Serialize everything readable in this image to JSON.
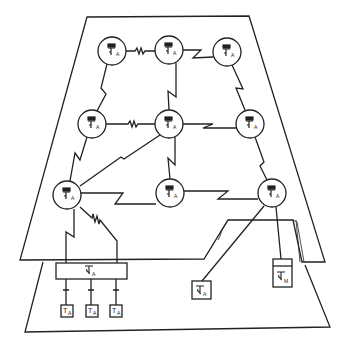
{
  "diagram": {
    "type": "network-topology",
    "colors": {
      "stroke": "#222222",
      "background": "#ffffff"
    },
    "planes": [
      {
        "id": "upper-plane",
        "label": ""
      },
      {
        "id": "lower-plane",
        "label": ""
      }
    ],
    "nodes": [
      {
        "id": "n1",
        "symbol": "T",
        "subscript": "A",
        "x": 112,
        "y": 51
      },
      {
        "id": "n2",
        "symbol": "T",
        "subscript": "A",
        "x": 169,
        "y": 50
      },
      {
        "id": "n3",
        "symbol": "T",
        "subscript": "A",
        "x": 227,
        "y": 52
      },
      {
        "id": "n4",
        "symbol": "T",
        "subscript": "A",
        "x": 92,
        "y": 124
      },
      {
        "id": "n5",
        "symbol": "T",
        "subscript": "A",
        "x": 169,
        "y": 124
      },
      {
        "id": "n6",
        "symbol": "T",
        "subscript": "A",
        "x": 250,
        "y": 124
      },
      {
        "id": "n7",
        "symbol": "T",
        "subscript": "A",
        "x": 67,
        "y": 195
      },
      {
        "id": "n8",
        "symbol": "T",
        "subscript": "A",
        "x": 170,
        "y": 193
      },
      {
        "id": "n9",
        "symbol": "T",
        "subscript": "A",
        "x": 272,
        "y": 193
      }
    ],
    "links": [
      {
        "from": "n1",
        "to": "n2",
        "kind": "resistor"
      },
      {
        "from": "n2",
        "to": "n3",
        "kind": "lightning"
      },
      {
        "from": "n1",
        "to": "n4",
        "kind": "lightning"
      },
      {
        "from": "n2",
        "to": "n5",
        "kind": "lightning"
      },
      {
        "from": "n3",
        "to": "n6",
        "kind": "lightning"
      },
      {
        "from": "n4",
        "to": "n5",
        "kind": "resistor"
      },
      {
        "from": "n5",
        "to": "n6",
        "kind": "lightning"
      },
      {
        "from": "n4",
        "to": "n7",
        "kind": "lightning"
      },
      {
        "from": "n5",
        "to": "n7",
        "kind": "lightning"
      },
      {
        "from": "n5",
        "to": "n8",
        "kind": "lightning"
      },
      {
        "from": "n6",
        "to": "n9",
        "kind": "lightning"
      },
      {
        "from": "n7",
        "to": "n8",
        "kind": "lightning"
      },
      {
        "from": "n8",
        "to": "n9",
        "kind": "lightning"
      },
      {
        "from": "n7",
        "to": "bus-box",
        "kind": "lightning"
      },
      {
        "from": "n7",
        "to": "bus-box",
        "kind": "resistor"
      },
      {
        "from": "n9",
        "to": "box-a",
        "kind": "line"
      },
      {
        "from": "n9",
        "to": "box-m",
        "kind": "line"
      }
    ],
    "bus_box": {
      "symbol": "T",
      "subscript": "A"
    },
    "terminals": [
      {
        "symbol": "T",
        "subscript": "A"
      },
      {
        "symbol": "T",
        "subscript": "A"
      },
      {
        "symbol": "T",
        "subscript": "A"
      }
    ],
    "box_a": {
      "symbol": "T",
      "subscript": "A"
    },
    "box_m": {
      "symbol": "T",
      "subscript": "M"
    }
  }
}
